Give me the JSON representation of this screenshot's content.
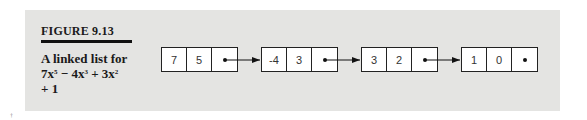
{
  "figure": {
    "label": "FIGURE 9.13",
    "caption_line1": "A linked list for",
    "caption_terms": [
      {
        "coef": "7x",
        "exp": "5",
        "op": " − "
      },
      {
        "coef": "4x",
        "exp": "3",
        "op": " + "
      },
      {
        "coef": "3x",
        "exp": "2",
        "op": ""
      }
    ],
    "caption_line3": "+ 1"
  },
  "nodes": [
    {
      "coefficient": "7",
      "exponent": "5",
      "next": "pointer"
    },
    {
      "coefficient": "-4",
      "exponent": "3",
      "next": "pointer"
    },
    {
      "coefficient": "3",
      "exponent": "2",
      "next": "pointer"
    },
    {
      "coefficient": "1",
      "exponent": "0",
      "next": "null"
    }
  ]
}
